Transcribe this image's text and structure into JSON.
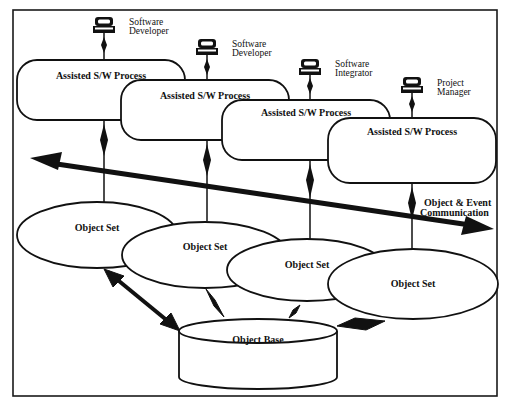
{
  "diagram": {
    "frame": {
      "stroke": "#1a1a1a"
    },
    "users": [
      {
        "role_line1": "Software",
        "role_line2": "Developer"
      },
      {
        "role_line1": "Software",
        "role_line2": "Developer"
      },
      {
        "role_line1": "Software",
        "role_line2": "Integrator"
      },
      {
        "role_line1": "Project",
        "role_line2": "Manager"
      }
    ],
    "processes": [
      {
        "label": "Assisted S/W Process"
      },
      {
        "label": "Assisted S/W Process"
      },
      {
        "label": "Assisted S/W Process"
      },
      {
        "label": "Assisted S/W Process"
      }
    ],
    "communication": {
      "line1": "Object & Event",
      "line2": "Communication"
    },
    "object_sets": [
      {
        "label": "Object Set"
      },
      {
        "label": "Object Set"
      },
      {
        "label": "Object Set"
      },
      {
        "label": "Object Set"
      }
    ],
    "object_base": {
      "label": "Object Base"
    },
    "colors": {
      "ink": "#111111",
      "background": "#ffffff"
    }
  }
}
